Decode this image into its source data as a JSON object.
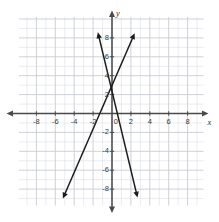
{
  "figure": {
    "kind": "coordinate-plane",
    "background_color": "#ffffff",
    "grid_color": "#c9ccd4",
    "grid_minor_color": "#e2e4e9",
    "axis_color": "#4a4a4a",
    "line_color": "#1c1c1c"
  },
  "axes": {
    "x_axis_label": "x",
    "y_axis_label": "y",
    "origin_label": "0",
    "x_tick_labels": [
      "-8",
      "-6",
      "-4",
      "-2",
      "2",
      "4",
      "6",
      "8"
    ],
    "x_tick_values": [
      -8,
      -6,
      -4,
      -2,
      2,
      4,
      6,
      8
    ],
    "y_tick_labels": [
      "8",
      "6",
      "4",
      "2",
      "-2",
      "-4",
      "-6",
      "-8"
    ],
    "y_tick_values": [
      8,
      6,
      4,
      2,
      -2,
      -4,
      -6,
      -8
    ],
    "xlim": [
      -9.5,
      9.2
    ],
    "ylim": [
      -9.7,
      9.7
    ],
    "grid": true,
    "grid_step": 1,
    "tick_step": 2
  },
  "chart_data": {
    "type": "line",
    "title": "",
    "xlabel": "x",
    "ylabel": "y",
    "xlim": [
      -9.5,
      9.2
    ],
    "ylim": [
      -9.7,
      9.7
    ],
    "grid": true,
    "legend": "none",
    "series": [
      {
        "name": "line-1",
        "slope": 2.3,
        "y_intercept": 3.0,
        "x_intercept": -1.3,
        "arrows": "both",
        "points": [
          [
            -5.2,
            -9.0
          ],
          [
            -1.3,
            0.0
          ],
          [
            0.0,
            3.0
          ],
          [
            2.4,
            8.5
          ]
        ]
      },
      {
        "name": "line-2",
        "slope": -4.0,
        "y_intercept": 2.6,
        "x_intercept": 0.65,
        "arrows": "both",
        "points": [
          [
            -1.5,
            8.6
          ],
          [
            -1.0,
            6.6
          ],
          [
            0.0,
            2.6
          ],
          [
            2.7,
            -8.9
          ]
        ]
      }
    ],
    "intersection": [
      -0.8,
      4.5
    ]
  }
}
